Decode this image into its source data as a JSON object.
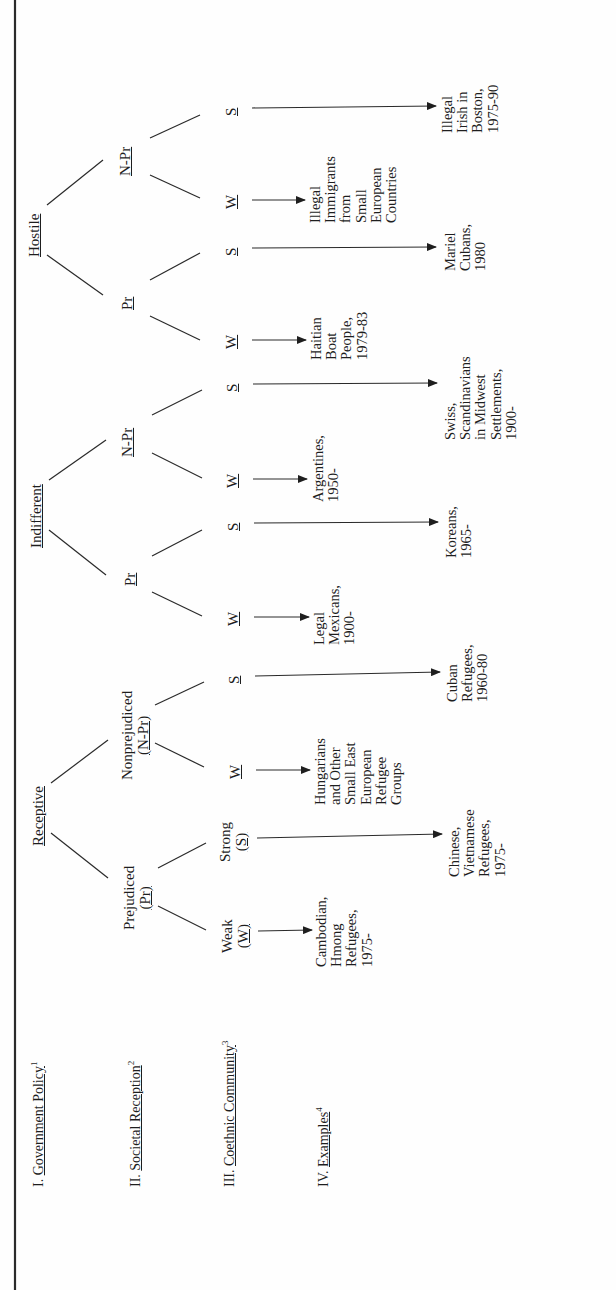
{
  "diagram": {
    "rows": {
      "government_policy": {
        "numeral": "I.",
        "label": "Government Policy",
        "footnote": "1"
      },
      "societal_reception": {
        "numeral": "II.",
        "label": "Societal Reception",
        "footnote": "2"
      },
      "coethnic_community": {
        "numeral": "III.",
        "label": "Coethnic Community",
        "footnote": "3"
      },
      "examples": {
        "numeral": "IV.",
        "label": "Examples",
        "footnote": "4"
      }
    },
    "policy": {
      "receptive": "Receptive",
      "indifferent": "Indifferent",
      "hostile": "Hostile"
    },
    "reception": {
      "receptive_pr_line1": "Prejudiced",
      "receptive_pr_line2": "(Pr)",
      "receptive_npr_line1": "Nonprejudiced",
      "receptive_npr_line2": "(N-Pr)",
      "indifferent_pr": "Pr",
      "indifferent_npr": "N-Pr",
      "hostile_pr": "Pr",
      "hostile_npr": "N-Pr"
    },
    "community": {
      "weak_line1": "Weak",
      "weak_line2": "(W)",
      "strong_line1": "Strong",
      "strong_line2": "(S)",
      "w": "W",
      "s": "S"
    },
    "examples": [
      {
        "id": "rec-pr-w",
        "lines": [
          "Cambodian,",
          "Hmong",
          "Refugees,",
          "1975-"
        ]
      },
      {
        "id": "rec-pr-s",
        "lines": [
          "Chinese,",
          "Vietnamese",
          "Refugees,",
          "1975-"
        ]
      },
      {
        "id": "rec-npr-w",
        "lines": [
          "Hungarians",
          "and Other",
          "Small East",
          "European",
          "Refugee",
          "Groups"
        ]
      },
      {
        "id": "rec-npr-s",
        "lines": [
          "Cuban",
          "Refugees,",
          "1960-80"
        ]
      },
      {
        "id": "ind-pr-w",
        "lines": [
          "Legal",
          "Mexicans,",
          "1900-"
        ]
      },
      {
        "id": "ind-pr-s",
        "lines": [
          "Koreans,",
          "1965-"
        ]
      },
      {
        "id": "ind-npr-w",
        "lines": [
          "Argentines,",
          "1950-"
        ]
      },
      {
        "id": "ind-npr-s",
        "lines": [
          "Swiss,",
          "Scandinavians",
          "in Midwest",
          "Settlements,",
          "1900-"
        ]
      },
      {
        "id": "hos-pr-w",
        "lines": [
          "Haitian",
          "Boat",
          "People,",
          "1979-83"
        ]
      },
      {
        "id": "hos-pr-s",
        "lines": [
          "Mariel",
          "Cubans,",
          "1980"
        ]
      },
      {
        "id": "hos-npr-w",
        "lines": [
          "Illegal",
          "Immigrants",
          "from",
          "Small",
          "European",
          "Countries"
        ]
      },
      {
        "id": "hos-npr-s",
        "lines": [
          "Illegal",
          "Irish in",
          "Boston,",
          "1975-90"
        ]
      }
    ]
  }
}
